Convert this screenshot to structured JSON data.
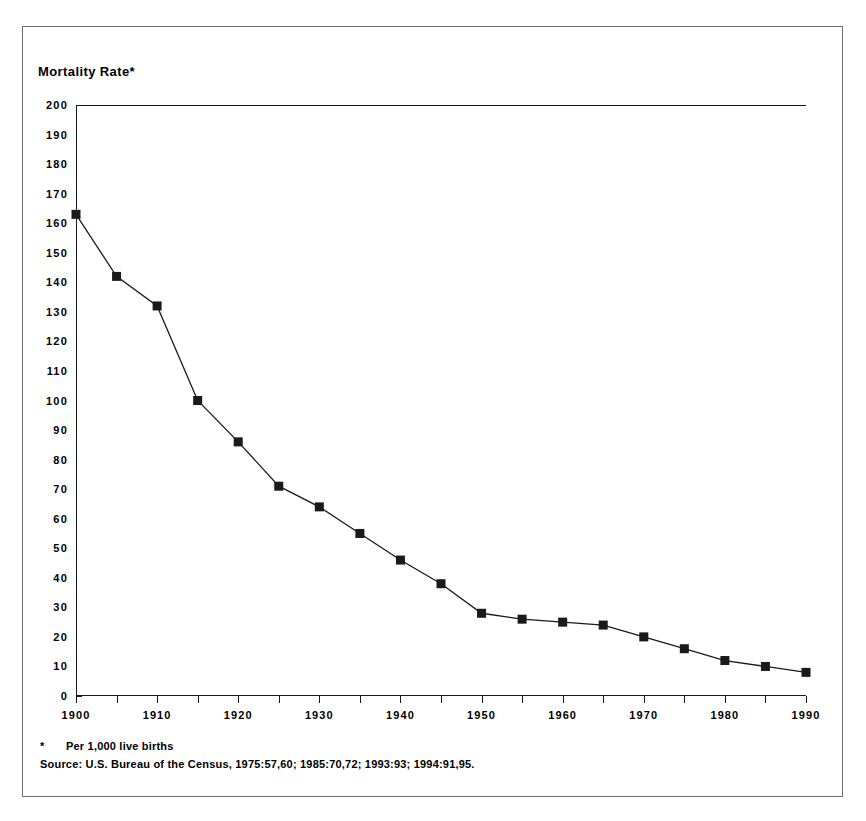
{
  "chart_data": {
    "type": "line",
    "title": "Mortality Rate*",
    "xlabel": "",
    "ylabel": "Mortality Rate",
    "xlim": [
      1900,
      1990
    ],
    "ylim": [
      0,
      200
    ],
    "x_tick_step": 5,
    "y_tick_step": 10,
    "grid": false,
    "legend": "none",
    "marker": "filled-square",
    "series_color": "#1a1a1a",
    "x": [
      1900,
      1905,
      1910,
      1915,
      1920,
      1925,
      1930,
      1935,
      1940,
      1945,
      1950,
      1955,
      1960,
      1965,
      1970,
      1975,
      1980,
      1985,
      1990
    ],
    "values": [
      163,
      142,
      132,
      100,
      86,
      71,
      64,
      55,
      46,
      38,
      28,
      26,
      25,
      24,
      20,
      16,
      12,
      10,
      8
    ],
    "x_tick_labels": [
      "1900",
      "1910",
      "1920",
      "1930",
      "1940",
      "1950",
      "1960",
      "1970",
      "1980",
      "1990"
    ],
    "x_tick_values": [
      1900,
      1910,
      1920,
      1930,
      1940,
      1950,
      1960,
      1970,
      1980,
      1990
    ],
    "y_tick_labels": [
      "200",
      "190",
      "180",
      "170",
      "160",
      "150",
      "140",
      "130",
      "120",
      "110",
      "100",
      "90",
      "80",
      "70",
      "60",
      "50",
      "40",
      "30",
      "20",
      "10",
      "0"
    ],
    "y_tick_values": [
      200,
      190,
      180,
      170,
      160,
      150,
      140,
      130,
      120,
      110,
      100,
      90,
      80,
      70,
      60,
      50,
      40,
      30,
      20,
      10,
      0
    ]
  },
  "footnotes": {
    "marker": "*",
    "note": "Per 1,000 live births",
    "source": "Source:  U.S. Bureau of the Census, 1975:57,60; 1985:70,72; 1993:93; 1994:91,95."
  }
}
